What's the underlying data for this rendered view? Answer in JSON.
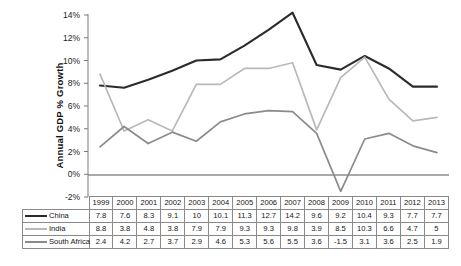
{
  "chart_data": {
    "type": "line",
    "title": "",
    "xlabel": "",
    "ylabel": "Annual GDP % Growth",
    "ylim": [
      -2,
      14
    ],
    "ytick_step": 2,
    "ytick_labels": [
      "14%",
      "12%",
      "10%",
      "8%",
      "6%",
      "4%",
      "2%",
      "0%",
      "-2%"
    ],
    "ytick_values": [
      14,
      12,
      10,
      8,
      6,
      4,
      2,
      0,
      -2
    ],
    "grid": false,
    "zero_line": true,
    "legend_position": "table-left",
    "categories": [
      "1999",
      "2000",
      "2001",
      "2002",
      "2003",
      "2004",
      "2005",
      "2006",
      "2007",
      "2008",
      "2009",
      "2010",
      "2011",
      "2012",
      "2013"
    ],
    "series": [
      {
        "name": "China",
        "color": "#2b2b2b",
        "width": 2.1,
        "values": [
          7.8,
          7.6,
          8.3,
          9.1,
          10,
          10.1,
          11.3,
          12.7,
          14.2,
          9.6,
          9.2,
          10.4,
          9.3,
          7.7,
          7.7
        ],
        "labels": [
          "7.8",
          "7.6",
          "8.3",
          "9.1",
          "10",
          "10.1",
          "11.3",
          "12.7",
          "14.2",
          "9.6",
          "9.2",
          "10.4",
          "9.3",
          "7.7",
          "7.7"
        ]
      },
      {
        "name": "India",
        "color": "#b9b9b9",
        "width": 1.7,
        "values": [
          8.8,
          3.8,
          4.8,
          3.8,
          7.9,
          7.9,
          9.3,
          9.3,
          9.8,
          3.9,
          8.5,
          10.3,
          6.6,
          4.7,
          5
        ],
        "labels": [
          "8.8",
          "3.8",
          "4.8",
          "3.8",
          "7.9",
          "7.9",
          "9.3",
          "9.3",
          "9.8",
          "3.9",
          "8.5",
          "10.3",
          "6.6",
          "4.7",
          "5"
        ]
      },
      {
        "name": "South Africa",
        "color": "#8b8b8b",
        "width": 1.7,
        "values": [
          2.4,
          4.2,
          2.7,
          3.7,
          2.9,
          4.6,
          5.3,
          5.6,
          5.5,
          3.6,
          -1.5,
          3.1,
          3.6,
          2.5,
          1.9
        ],
        "labels": [
          "2.4",
          "4.2",
          "2.7",
          "3.7",
          "2.9",
          "4.6",
          "5.3",
          "5.6",
          "5.5",
          "3.6",
          "-1.5",
          "3.1",
          "3.6",
          "2.5",
          "1.9"
        ]
      }
    ]
  },
  "table": {
    "corner_label": "",
    "year_headers": [
      "1999",
      "2000",
      "2001",
      "2002",
      "2003",
      "2004",
      "2005",
      "2006",
      "2007",
      "2008",
      "2009",
      "2010",
      "2011",
      "2012",
      "2013"
    ],
    "rows": [
      {
        "name": "China",
        "values": [
          "7.8",
          "7.6",
          "8.3",
          "9.1",
          "10",
          "10.1",
          "11.3",
          "12.7",
          "14.2",
          "9.6",
          "9.2",
          "10.4",
          "9.3",
          "7.7",
          "7.7"
        ]
      },
      {
        "name": "India",
        "values": [
          "8.8",
          "3.8",
          "4.8",
          "3.8",
          "7.9",
          "7.9",
          "9.3",
          "9.3",
          "9.8",
          "3.9",
          "8.5",
          "10.3",
          "6.6",
          "4.7",
          "5"
        ]
      },
      {
        "name": "South Africa",
        "values": [
          "2.4",
          "4.2",
          "2.7",
          "3.7",
          "2.9",
          "4.6",
          "5.3",
          "5.6",
          "5.5",
          "3.6",
          "-1.5",
          "3.1",
          "3.6",
          "2.5",
          "1.9"
        ]
      }
    ]
  }
}
